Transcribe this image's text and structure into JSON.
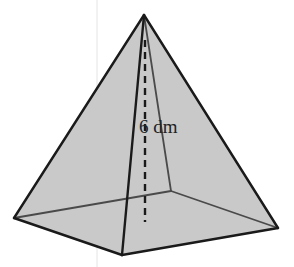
{
  "figure": {
    "type": "square-pyramid",
    "height_label": "6 dm",
    "colors": {
      "background": "#ffffff",
      "face_fill": "#c9c9c9",
      "edge": "#1a1a1a",
      "hidden_edge": "#4a4a4a"
    }
  }
}
